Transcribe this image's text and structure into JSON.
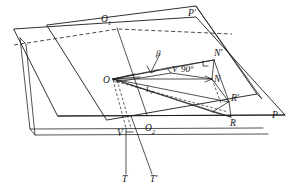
{
  "figure": {
    "background_color": "#ffffff",
    "line_color": "#1a1a1a",
    "width": 293,
    "height": 192
  },
  "labels": {
    "plane_lower": "P",
    "plane_upper": "P'",
    "origin": "O",
    "intersection_upper": "O",
    "intersection_upper_sub": "1",
    "intersection_lower": "O",
    "intersection_lower_sub": "2",
    "normal_prime": "N'",
    "normal": "N",
    "ray_prime": "R'",
    "ray": "R",
    "vertical": "V",
    "trace": "T",
    "trace_prime": "T'",
    "angle_beta": "β",
    "angle_right_label": "V",
    "angle_right_value": "90°",
    "incidence": "i",
    "incidence_sub": "v"
  },
  "elements": [
    {
      "name": "plane-p-outline",
      "kind": "parallelogram",
      "interactable": false
    },
    {
      "name": "plane-p-prime-outline",
      "kind": "parallelogram",
      "interactable": false
    },
    {
      "name": "slab-offset-edge",
      "kind": "polyline",
      "interactable": false
    },
    {
      "name": "intersection-line",
      "kind": "line",
      "interactable": false
    },
    {
      "name": "vector-o-to-n-prime",
      "kind": "vector",
      "interactable": false
    },
    {
      "name": "vector-o-to-n",
      "kind": "vector",
      "interactable": false
    },
    {
      "name": "vector-o-to-r-prime",
      "kind": "vector",
      "interactable": false
    },
    {
      "name": "vector-o-to-r",
      "kind": "vector",
      "interactable": false
    },
    {
      "name": "vertical-drop-line",
      "kind": "line",
      "interactable": false
    },
    {
      "name": "trace-line-t",
      "kind": "line",
      "interactable": false
    },
    {
      "name": "trace-line-t-prime",
      "kind": "line",
      "interactable": false
    },
    {
      "name": "right-angle-marker",
      "kind": "marker",
      "interactable": false
    },
    {
      "name": "beta-angle-arrow",
      "kind": "marker",
      "interactable": false
    }
  ]
}
